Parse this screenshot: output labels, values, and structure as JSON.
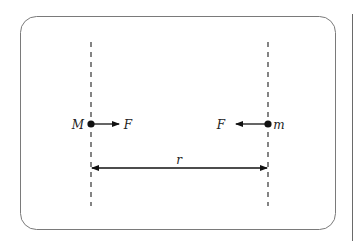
{
  "diagram": {
    "type": "gravitational-force-between-two-masses",
    "colors": {
      "stroke": "#111111",
      "frame": "#7a7a7a",
      "background": "#ffffff"
    },
    "mass_left": {
      "label": "M"
    },
    "mass_right": {
      "label": "m"
    },
    "force_left": {
      "label": "F",
      "direction": "right"
    },
    "force_right": {
      "label": "F",
      "direction": "left"
    },
    "separation": {
      "label": "r"
    }
  }
}
